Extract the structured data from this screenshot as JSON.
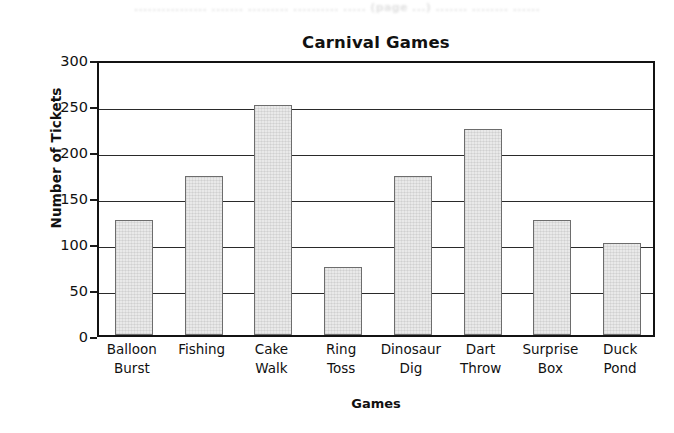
{
  "scan_artifact_text": "................ ....... ......... .......... ..... (page ...) ....... ........ ......",
  "chart_data": {
    "type": "bar",
    "title": "Carnival Games",
    "xlabel": "Games",
    "ylabel": "Number of Tickets",
    "categories": [
      "Balloon Burst",
      "Fishing",
      "Cake Walk",
      "Ring Toss",
      "Dinosaur Dig",
      "Dart Throw",
      "Surprise Box",
      "Duck Pond"
    ],
    "category_lines": [
      [
        "Balloon",
        "Burst"
      ],
      [
        "Fishing",
        ""
      ],
      [
        "Cake",
        "Walk"
      ],
      [
        "Ring",
        "Toss"
      ],
      [
        "Dinosaur",
        "Dig"
      ],
      [
        "Dart",
        "Throw"
      ],
      [
        "Surprise",
        "Box"
      ],
      [
        "Duck",
        "Pond"
      ]
    ],
    "values": [
      125,
      173,
      250,
      74,
      173,
      224,
      125,
      100
    ],
    "ylim": [
      0,
      300
    ],
    "ytick_values": [
      0,
      50,
      100,
      150,
      200,
      250,
      300
    ],
    "ytick_labels": [
      "0",
      "50",
      "100",
      "150",
      "200",
      "250",
      "300"
    ],
    "grid": true,
    "legend": false,
    "bar_fill_color": "#e9e9e9",
    "bar_border_color": "#6d6d6d",
    "axis_color": "#131313",
    "gridline_color": "#2a2a2a"
  }
}
